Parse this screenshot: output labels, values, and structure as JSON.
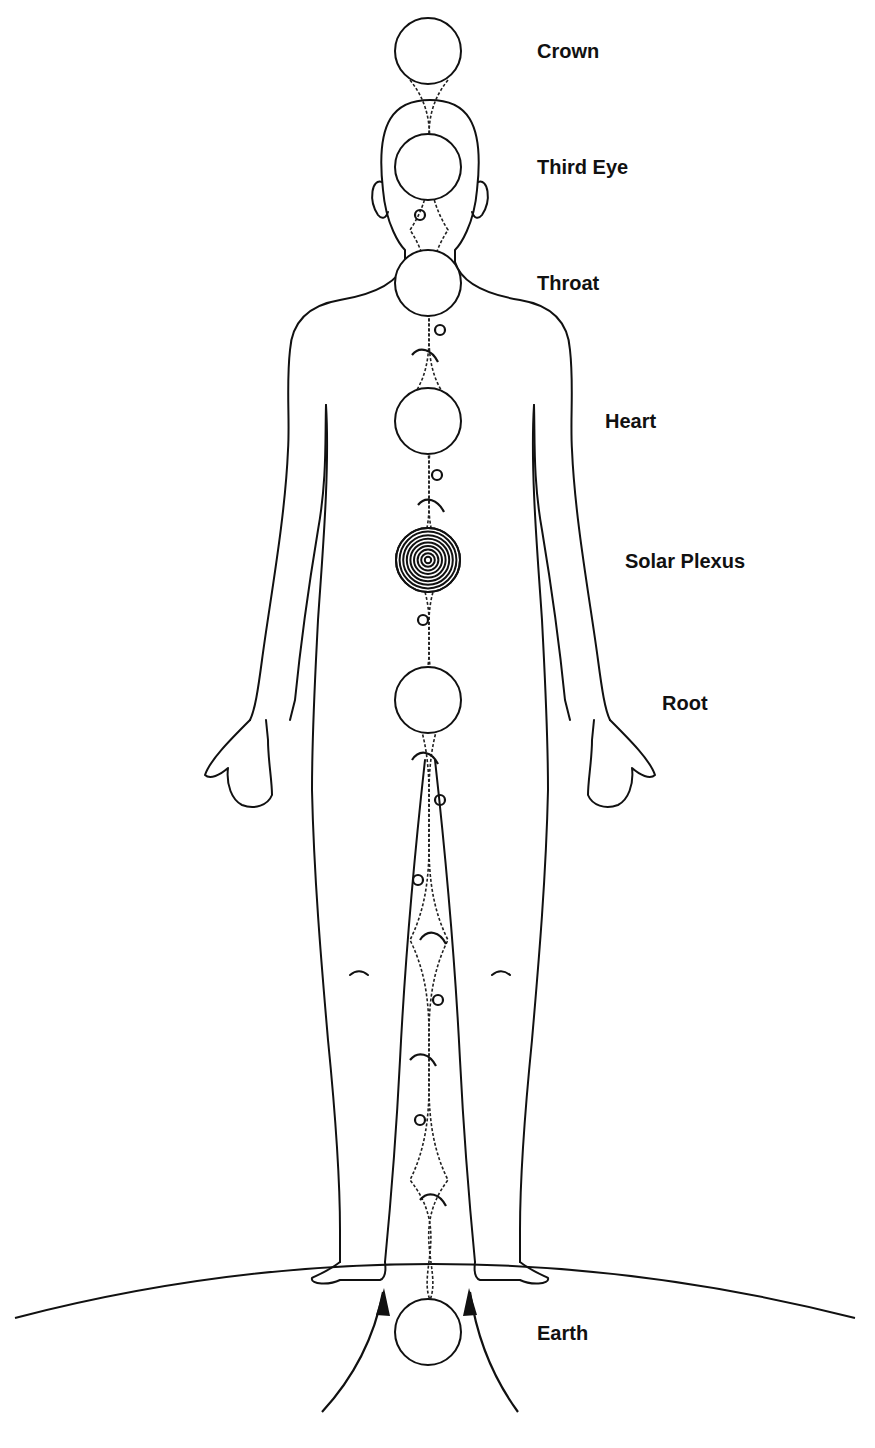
{
  "diagram": {
    "type": "chakra-body-diagram",
    "line_color": "#111111",
    "background": "#ffffff",
    "chakras": [
      {
        "id": "crown",
        "label": "Crown",
        "cx": 428,
        "cy": 51,
        "r": 33,
        "style": "plain",
        "label_x": 537,
        "label_y": 40
      },
      {
        "id": "third-eye",
        "label": "Third Eye",
        "cx": 428,
        "cy": 167,
        "r": 33,
        "style": "plain",
        "label_x": 537,
        "label_y": 156
      },
      {
        "id": "throat",
        "label": "Throat",
        "cx": 428,
        "cy": 283,
        "r": 33,
        "style": "plain",
        "label_x": 537,
        "label_y": 272
      },
      {
        "id": "heart",
        "label": "Heart",
        "cx": 428,
        "cy": 421,
        "r": 33,
        "style": "plain",
        "label_x": 605,
        "label_y": 410
      },
      {
        "id": "solar-plexus",
        "label": "Solar Plexus",
        "cx": 428,
        "cy": 560,
        "r": 32,
        "style": "concentric",
        "label_x": 625,
        "label_y": 550
      },
      {
        "id": "root",
        "label": "Root",
        "cx": 428,
        "cy": 700,
        "r": 33,
        "style": "plain",
        "label_x": 662,
        "label_y": 692
      },
      {
        "id": "earth",
        "label": "Earth",
        "cx": 428,
        "cy": 1332,
        "r": 33,
        "style": "plain",
        "label_x": 537,
        "label_y": 1322
      }
    ]
  }
}
